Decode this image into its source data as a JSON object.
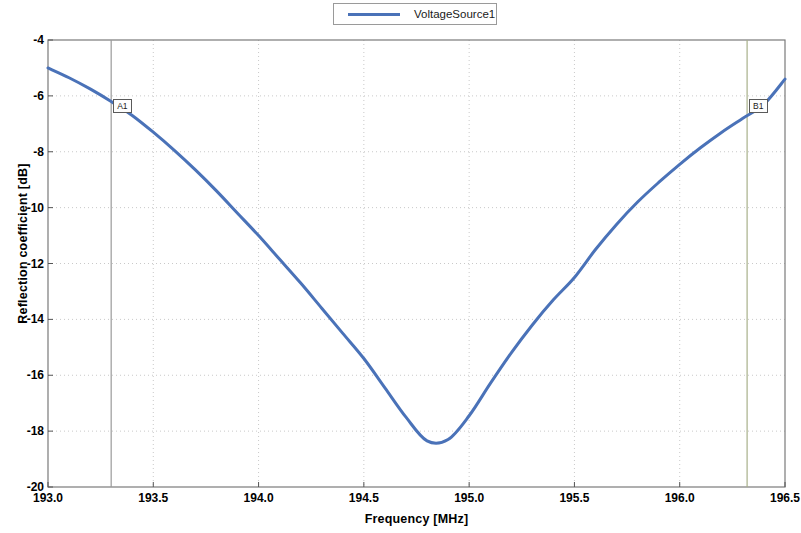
{
  "chart_data": {
    "type": "line",
    "title": "",
    "xlabel": "Frequency [MHz]",
    "ylabel": "Reflection coefficient [dB]",
    "xlim": [
      193.0,
      196.5
    ],
    "ylim": [
      -20,
      -4
    ],
    "xticks": [
      "193.0",
      "193.5",
      "194.0",
      "194.5",
      "195.0",
      "195.5",
      "196.0",
      "196.5"
    ],
    "xtick_values": [
      193.0,
      193.5,
      194.0,
      194.5,
      195.0,
      195.5,
      196.0,
      196.5
    ],
    "yticks": [
      "-4",
      "-6",
      "-8",
      "-10",
      "-12",
      "-14",
      "-16",
      "-18",
      "-20"
    ],
    "ytick_values": [
      -4,
      -6,
      -8,
      -10,
      -12,
      -14,
      -16,
      -18,
      -20
    ],
    "grid": true,
    "legend_position": "top-center",
    "series": [
      {
        "name": "VoltageSource1",
        "color": "#4a72b8",
        "x": [
          193.0,
          193.1,
          193.2,
          193.3,
          193.4,
          193.5,
          193.6,
          193.7,
          193.8,
          193.9,
          194.0,
          194.1,
          194.2,
          194.3,
          194.4,
          194.5,
          194.6,
          194.7,
          194.8,
          194.9,
          195.0,
          195.1,
          195.2,
          195.3,
          195.4,
          195.5,
          195.6,
          195.7,
          195.8,
          195.9,
          196.0,
          196.1,
          196.2,
          196.3,
          196.4,
          196.5
        ],
        "y": [
          -5.0,
          -5.35,
          -5.75,
          -6.2,
          -6.7,
          -7.3,
          -7.95,
          -8.65,
          -9.4,
          -10.2,
          -11.0,
          -11.85,
          -12.7,
          -13.6,
          -14.5,
          -15.4,
          -16.45,
          -17.5,
          -18.35,
          -18.3,
          -17.45,
          -16.3,
          -15.2,
          -14.2,
          -13.3,
          -12.5,
          -11.5,
          -10.6,
          -9.8,
          -9.1,
          -8.45,
          -7.85,
          -7.3,
          -6.8,
          -6.3,
          -5.4
        ]
      }
    ],
    "markers": [
      {
        "label": "A1",
        "x": 193.3,
        "line_color": "#9a9a9a"
      },
      {
        "label": "B1",
        "x": 196.32,
        "line_color": "#a8b08a"
      }
    ]
  },
  "legend": {
    "entries": [
      {
        "label": "VoltageSource1"
      }
    ]
  }
}
